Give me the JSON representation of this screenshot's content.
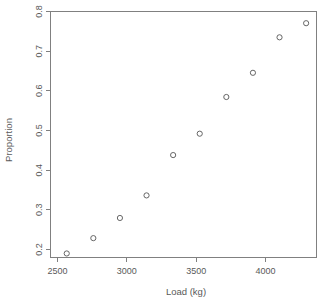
{
  "chart_data": {
    "type": "scatter",
    "title": "",
    "xlabel": "Load (kg)",
    "ylabel": "Proportion",
    "xlim": [
      2378,
      4378
    ],
    "ylim": [
      0.19,
      0.8
    ],
    "grid": false,
    "legend": null,
    "marker": "open-circle",
    "x": [
      2500,
      2700,
      2900,
      3100,
      3300,
      3500,
      3700,
      3900,
      4100,
      4300
    ],
    "y": [
      0.2,
      0.238,
      0.288,
      0.344,
      0.444,
      0.497,
      0.588,
      0.648,
      0.736,
      0.771
    ],
    "points": [
      {
        "x": 2500,
        "y": 0.2
      },
      {
        "x": 2700,
        "y": 0.238
      },
      {
        "x": 2900,
        "y": 0.288
      },
      {
        "x": 3100,
        "y": 0.344
      },
      {
        "x": 3300,
        "y": 0.444
      },
      {
        "x": 3500,
        "y": 0.497
      },
      {
        "x": 3700,
        "y": 0.588
      },
      {
        "x": 3900,
        "y": 0.648
      },
      {
        "x": 4100,
        "y": 0.736
      },
      {
        "x": 4300,
        "y": 0.771
      }
    ],
    "xticks": [
      2500,
      3000,
      3500,
      4000
    ],
    "xtick_labels": [
      "2500",
      "3000",
      "3500",
      "4000"
    ],
    "yticks": [
      0.2,
      0.3,
      0.4,
      0.5,
      0.6,
      0.7,
      0.8
    ],
    "ytick_labels": [
      "0.2",
      "0.3",
      "0.4",
      "0.5",
      "0.6",
      "0.7",
      "0.8"
    ],
    "colors": {
      "background": "#ffffff",
      "axis": "#808080",
      "marker": "#666666",
      "text": "#595959"
    }
  },
  "axes": {
    "x_title": "Load (kg)",
    "y_title": "Proportion"
  }
}
